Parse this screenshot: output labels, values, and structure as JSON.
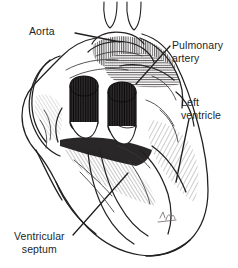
{
  "figure": {
    "type": "line-drawing",
    "ink_color": "#221f1f",
    "background_color": "#ffffff",
    "width": 238,
    "height": 268,
    "signature": "artist-initials"
  },
  "labels": [
    {
      "id": "aorta",
      "lines": [
        "Aorta"
      ],
      "leader": {
        "x1": 75,
        "y1": 33,
        "x2": 120,
        "y2": 42
      }
    },
    {
      "id": "pulmonary_artery",
      "lines": [
        "Pulmonary",
        "artery"
      ],
      "leader": {
        "x1": 170,
        "y1": 46,
        "x2": 136,
        "y2": 84
      }
    },
    {
      "id": "left_ventricle",
      "lines": [
        "Left",
        "ventricle"
      ],
      "leader": {
        "x1": 189,
        "y1": 119,
        "x2": 176,
        "y2": 182
      }
    },
    {
      "id": "ventricular_septum",
      "lines": [
        "Ventricular",
        "septum"
      ],
      "leader": {
        "x1": 73,
        "y1": 235,
        "x2": 128,
        "y2": 173
      }
    }
  ]
}
